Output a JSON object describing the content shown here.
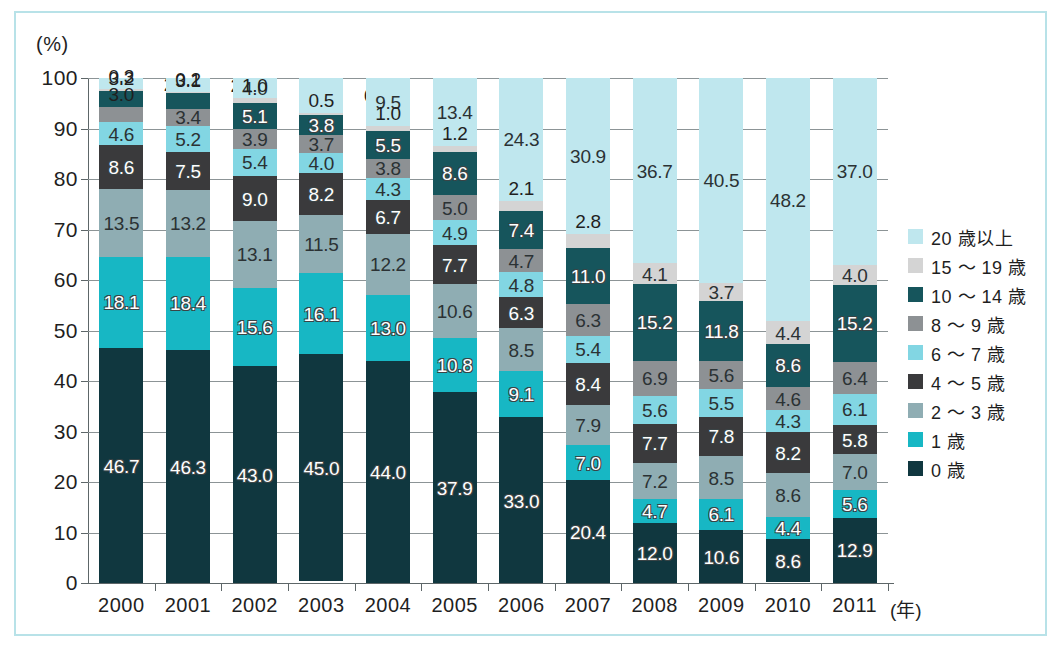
{
  "axis": {
    "y_unit": "(%)",
    "y_ticks": [
      "100",
      "90",
      "80",
      "70",
      "60",
      "50",
      "40",
      "30",
      "20",
      "10",
      "0"
    ],
    "x_unit": "(年)"
  },
  "legend": {
    "items": [
      {
        "label": "20 歳以上",
        "color": "#bfe7ee"
      },
      {
        "label": "15 〜 19 歳",
        "color": "#d4d4d4"
      },
      {
        "label": "10 〜 14 歳",
        "color": "#16555c"
      },
      {
        "label": "8 〜 9 歳",
        "color": "#8d9194"
      },
      {
        "label": "6 〜 7 歳",
        "color": "#82d6e3"
      },
      {
        "label": "4 〜 5 歳",
        "color": "#3a3a3c"
      },
      {
        "label": "2 〜 3 歳",
        "color": "#8fadb3"
      },
      {
        "label": "1 歳",
        "color": "#17b7c4"
      },
      {
        "label": "0 歳",
        "color": "#10373f"
      }
    ]
  },
  "chart_data": {
    "type": "bar",
    "subtype": "stacked-100-percent",
    "title": "",
    "xlabel": "(年)",
    "ylabel": "(%)",
    "ylim": [
      0,
      100
    ],
    "ytick_step": 10,
    "grid": true,
    "legend_position": "right",
    "categories": [
      "2000",
      "2001",
      "2002",
      "2003",
      "2004",
      "2005",
      "2006",
      "2007",
      "2008",
      "2009",
      "2010",
      "2011"
    ],
    "series": [
      {
        "name": "0 歳",
        "color": "#10373f",
        "text": "light",
        "values": [
          46.7,
          46.3,
          43.0,
          45.0,
          44.0,
          37.9,
          33.0,
          20.4,
          12.0,
          10.6,
          8.6,
          12.9
        ]
      },
      {
        "name": "1 歳",
        "color": "#17b7c4",
        "text": "light",
        "values": [
          18.1,
          18.4,
          15.6,
          16.1,
          13.0,
          10.8,
          9.1,
          7.0,
          4.7,
          6.1,
          4.4,
          5.6
        ]
      },
      {
        "name": "2 〜 3 歳",
        "color": "#8fadb3",
        "text": "dark",
        "values": [
          13.5,
          13.2,
          13.1,
          11.5,
          12.2,
          10.6,
          8.5,
          7.9,
          7.2,
          8.5,
          8.6,
          7.0
        ]
      },
      {
        "name": "4 〜 5 歳",
        "color": "#3a3a3c",
        "text": "light",
        "values": [
          8.6,
          7.5,
          9.0,
          8.2,
          6.7,
          7.7,
          6.3,
          8.4,
          7.7,
          7.8,
          8.2,
          5.8
        ]
      },
      {
        "name": "6 〜 7 歳",
        "color": "#82d6e3",
        "text": "dark",
        "values": [
          4.6,
          5.2,
          5.4,
          4.0,
          4.3,
          4.9,
          4.8,
          5.4,
          5.6,
          5.5,
          4.3,
          6.1
        ]
      },
      {
        "name": "8 〜 9 歳",
        "color": "#8d9194",
        "text": "dark",
        "values": [
          3.0,
          3.4,
          3.9,
          3.7,
          3.8,
          5.0,
          4.7,
          6.3,
          6.9,
          5.6,
          4.6,
          6.4
        ]
      },
      {
        "name": "10 〜 14 歳",
        "color": "#16555c",
        "text": "light",
        "values": [
          3.2,
          3.1,
          5.1,
          3.8,
          5.5,
          8.6,
          7.4,
          11.0,
          15.2,
          11.8,
          8.6,
          15.2
        ]
      },
      {
        "name": "15 〜 19 歳",
        "color": "#d4d4d4",
        "text": "dark",
        "values": [
          0.3,
          0.2,
          1.0,
          0.5,
          1.0,
          1.2,
          2.1,
          2.8,
          4.1,
          3.7,
          4.4,
          4.0
        ]
      },
      {
        "name": "20 歳以上",
        "color": "#bfe7ee",
        "text": "dark",
        "values": [
          2.2,
          2.8,
          4.0,
          6.9,
          9.5,
          13.4,
          24.3,
          30.9,
          36.7,
          40.5,
          48.2,
          37.0
        ]
      }
    ],
    "label_overrides": {
      "0.8": "outside-right",
      "1.8": "outside-right",
      "3.8": "outside-right"
    }
  }
}
